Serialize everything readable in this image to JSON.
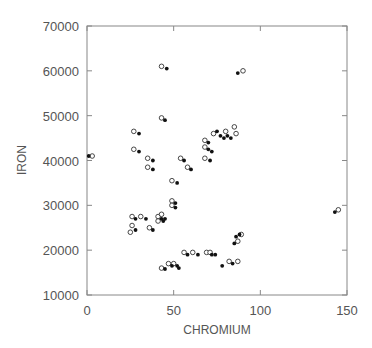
{
  "chart_data": {
    "type": "scatter",
    "title": "",
    "xlabel": "CHROMIUM",
    "ylabel": "IRON",
    "xlim": [
      0,
      150
    ],
    "ylim": [
      10000,
      70000
    ],
    "x_ticks": [
      0,
      50,
      100,
      150
    ],
    "y_ticks": [
      10000,
      20000,
      30000,
      40000,
      50000,
      60000,
      70000
    ],
    "x_tick_labels": [
      "0",
      "50",
      "100",
      "150"
    ],
    "y_tick_labels": [
      "10000",
      "20000",
      "30000",
      "40000",
      "50000",
      "60000",
      "70000"
    ],
    "grid": false,
    "legend": null,
    "series": [
      {
        "name": "open",
        "marker": "open-circle",
        "points": [
          [
            3,
            41000
          ],
          [
            43,
            61000
          ],
          [
            90,
            60000
          ],
          [
            43,
            49500
          ],
          [
            27,
            46500
          ],
          [
            27,
            42500
          ],
          [
            35,
            40500
          ],
          [
            35,
            38500
          ],
          [
            54,
            40500
          ],
          [
            58,
            38500
          ],
          [
            49,
            35500
          ],
          [
            49,
            31000
          ],
          [
            49,
            30000
          ],
          [
            68,
            44500
          ],
          [
            68,
            43000
          ],
          [
            68,
            40500
          ],
          [
            73,
            46000
          ],
          [
            80,
            46500
          ],
          [
            85,
            47500
          ],
          [
            86,
            46000
          ],
          [
            26,
            27500
          ],
          [
            26,
            25500
          ],
          [
            25,
            24000
          ],
          [
            31,
            27500
          ],
          [
            36,
            25000
          ],
          [
            41,
            27500
          ],
          [
            41,
            26500
          ],
          [
            43,
            28000
          ],
          [
            56,
            19500
          ],
          [
            61,
            19500
          ],
          [
            69,
            19500
          ],
          [
            71,
            19500
          ],
          [
            82,
            17500
          ],
          [
            87,
            17500
          ],
          [
            89,
            23500
          ],
          [
            87,
            22000
          ],
          [
            43,
            16000
          ],
          [
            47,
            17000
          ],
          [
            50,
            17000
          ],
          [
            145,
            29000
          ]
        ]
      },
      {
        "name": "filled",
        "marker": "filled-circle",
        "points": [
          [
            1,
            41000
          ],
          [
            46,
            60500
          ],
          [
            87,
            59500
          ],
          [
            45,
            49000
          ],
          [
            30,
            46000
          ],
          [
            30,
            42000
          ],
          [
            38,
            40000
          ],
          [
            38,
            38000
          ],
          [
            56,
            40000
          ],
          [
            60,
            38000
          ],
          [
            52,
            35000
          ],
          [
            51,
            30500
          ],
          [
            51,
            29500
          ],
          [
            70,
            44000
          ],
          [
            70,
            42500
          ],
          [
            72,
            42000
          ],
          [
            75,
            46500
          ],
          [
            77,
            45500
          ],
          [
            79,
            45000
          ],
          [
            81,
            45500
          ],
          [
            83,
            45000
          ],
          [
            71,
            40000
          ],
          [
            28,
            27000
          ],
          [
            28,
            24500
          ],
          [
            34,
            27000
          ],
          [
            38,
            24500
          ],
          [
            43,
            27000
          ],
          [
            44,
            26500
          ],
          [
            45,
            27000
          ],
          [
            58,
            19000
          ],
          [
            64,
            19000
          ],
          [
            72,
            19000
          ],
          [
            74,
            19000
          ],
          [
            78,
            16500
          ],
          [
            84,
            17000
          ],
          [
            86,
            23000
          ],
          [
            85,
            21500
          ],
          [
            88,
            23500
          ],
          [
            45,
            15800
          ],
          [
            49,
            16500
          ],
          [
            52,
            16500
          ],
          [
            53,
            16000
          ],
          [
            143,
            28500
          ]
        ]
      }
    ]
  }
}
